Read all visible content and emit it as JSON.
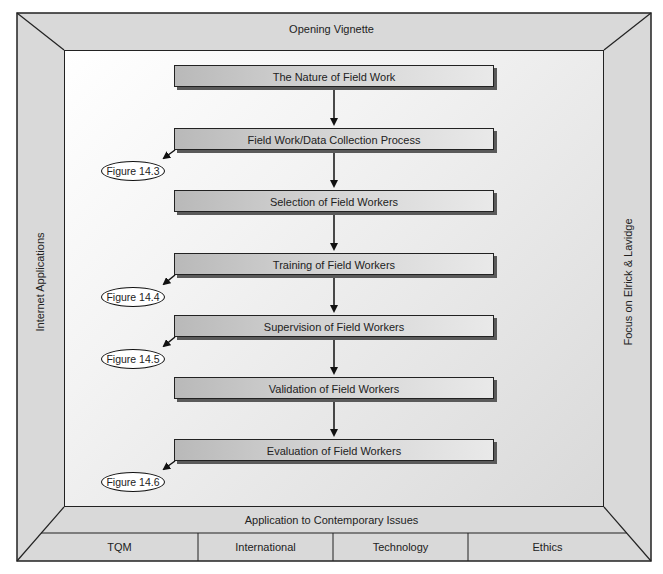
{
  "frame": {
    "top": "Opening Vignette",
    "left": "Internet Applications",
    "right": "Focus on Elrick & Lavidge",
    "bottom": "Application to Contemporary Issues",
    "bottom_cells": [
      "TQM",
      "International",
      "Technology",
      "Ethics"
    ]
  },
  "flow": {
    "steps": [
      {
        "label": "The Nature of Field Work"
      },
      {
        "label": "Field Work/Data Collection Process",
        "figure": "Figure 14.3"
      },
      {
        "label": "Selection of Field Workers"
      },
      {
        "label": "Training of Field Workers",
        "figure": "Figure 14.4"
      },
      {
        "label": "Supervision of Field Workers",
        "figure": "Figure 14.5"
      },
      {
        "label": "Validation of Field Workers"
      },
      {
        "label": "Evaluation of Field Workers",
        "figure": "Figure 14.6"
      }
    ]
  },
  "colors": {
    "frame_fill": "#d8d8d8",
    "line": "#222222",
    "box_gradient_start": "#b9b9b9",
    "box_gradient_end": "#e9e9e9"
  }
}
